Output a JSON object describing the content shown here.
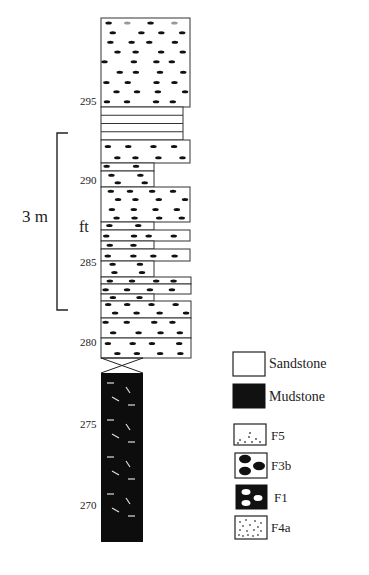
{
  "scale": {
    "bar_label": "3 m",
    "unit_label": "ft",
    "ticks": [
      {
        "label": "295",
        "y": 101
      },
      {
        "label": "290",
        "y": 180
      },
      {
        "label": "285",
        "y": 262
      },
      {
        "label": "280",
        "y": 342
      },
      {
        "label": "275",
        "y": 424
      },
      {
        "label": "270",
        "y": 505
      }
    ]
  },
  "column": {
    "left": 101,
    "beds": [
      {
        "type": "sandstone",
        "top": 18,
        "bottom": 107,
        "right": 190,
        "dots": "F5-top"
      },
      {
        "type": "laminated",
        "top": 107,
        "bottom": 140,
        "right": 183,
        "lines": 4
      },
      {
        "type": "sandstone",
        "top": 140,
        "bottom": 163,
        "right": 190
      },
      {
        "type": "sandstone",
        "top": 163,
        "bottom": 171,
        "right": 154
      },
      {
        "type": "sandstone",
        "top": 171,
        "bottom": 187,
        "right": 154
      },
      {
        "type": "sandstone",
        "top": 187,
        "bottom": 222,
        "right": 190
      },
      {
        "type": "sandstone",
        "top": 222,
        "bottom": 230,
        "right": 154
      },
      {
        "type": "sandstone",
        "top": 230,
        "bottom": 241,
        "right": 190
      },
      {
        "type": "sandstone",
        "top": 241,
        "bottom": 249,
        "right": 154
      },
      {
        "type": "sandstone",
        "top": 249,
        "bottom": 261,
        "right": 190
      },
      {
        "type": "sandstone",
        "top": 261,
        "bottom": 277,
        "right": 154
      },
      {
        "type": "sandstone",
        "top": 277,
        "bottom": 284,
        "right": 191
      },
      {
        "type": "sandstone",
        "top": 284,
        "bottom": 294,
        "right": 191
      },
      {
        "type": "sandstone",
        "top": 294,
        "bottom": 301,
        "right": 154
      },
      {
        "type": "sandstone",
        "top": 301,
        "bottom": 318,
        "right": 191
      },
      {
        "type": "sandstone",
        "top": 318,
        "bottom": 338,
        "right": 191
      },
      {
        "type": "sandstone",
        "top": 338,
        "bottom": 358,
        "right": 191
      },
      {
        "type": "contact",
        "top": 358,
        "bottom": 373,
        "right": 143
      },
      {
        "type": "mudstone",
        "top": 373,
        "bottom": 542,
        "right": 143
      }
    ]
  },
  "legend": {
    "items": [
      {
        "key": "sandstone",
        "label": "Sandstone"
      },
      {
        "key": "mudstone",
        "label": "Mudstone"
      },
      {
        "key": "F5",
        "label": "F5"
      },
      {
        "key": "F3b",
        "label": "F3b"
      },
      {
        "key": "F1",
        "label": "F1"
      },
      {
        "key": "F4a",
        "label": "F4a"
      }
    ]
  },
  "colors": {
    "ink": "#111111",
    "line": "#333333",
    "paper": "#ffffff",
    "grey_pebble": "#999999"
  }
}
